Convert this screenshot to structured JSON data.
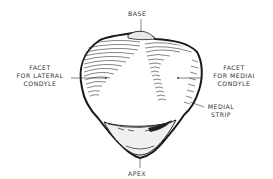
{
  "diagram": {
    "labels": {
      "base": "BASE",
      "lateral_facet": [
        "FACET",
        "FOR LATERAL",
        "CONDYLE"
      ],
      "medial_facet": [
        "FACET",
        "FOR MEDIAI",
        "CONDYLE"
      ],
      "medial_strip": [
        "MEDIAL",
        "STRIP"
      ],
      "apex": "APEX"
    },
    "colors": {
      "ink": "#1a1a1a",
      "label_text": "#333333",
      "background": "#ffffff"
    }
  }
}
